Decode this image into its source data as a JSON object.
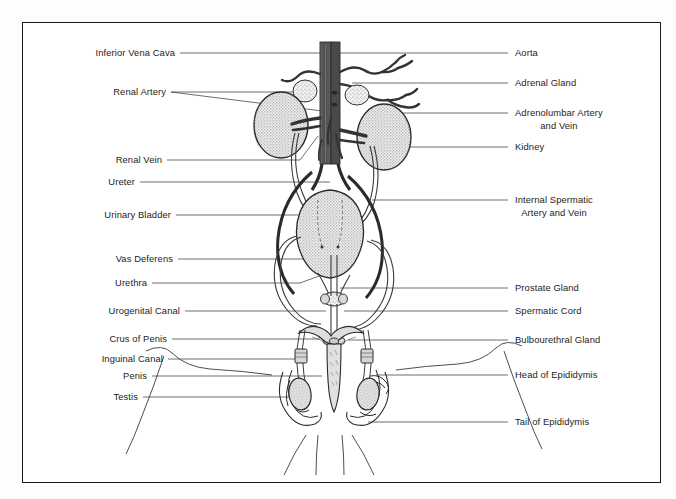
{
  "figure": {
    "frame": {
      "border_color": "#1a1a1a",
      "background": "#ffffff"
    },
    "colors": {
      "vessel_dark": "#555555",
      "vessel_outline": "#2b2b2b",
      "organ_fill": "#e9e9e9",
      "organ_stipple": "#6e6e6e",
      "duct_line": "#3a3a3a",
      "label_text": "#1c1c1c",
      "leader_line": "#4a4a4a"
    }
  },
  "labels_left": [
    {
      "id": "inferior-vena-cava",
      "text": "Inferior Vena Cava",
      "y": 53,
      "leader_x_end": 322
    },
    {
      "id": "renal-artery",
      "text": "Renal Artery",
      "y": 92,
      "leader_x_end": 330
    },
    {
      "id": "renal-vein",
      "text": "Renal Vein",
      "y": 160,
      "leader_x_end": 318
    },
    {
      "id": "ureter",
      "text": "Ureter",
      "y": 182,
      "leader_x_end": 330
    },
    {
      "id": "urinary-bladder",
      "text": "Urinary Bladder",
      "y": 215,
      "leader_x_end": 305
    },
    {
      "id": "vas-deferens",
      "text": "Vas Deferens",
      "y": 259,
      "leader_x_end": 330
    },
    {
      "id": "urethra",
      "text": "Urethra",
      "y": 283,
      "leader_x_end": 330
    },
    {
      "id": "urogenital-canal",
      "text": "Urogenital Canal",
      "y": 311,
      "leader_x_end": 326
    },
    {
      "id": "crus-of-penis",
      "text": "Crus of Penis",
      "y": 339,
      "leader_x_end": 320
    },
    {
      "id": "inguinal-canal",
      "text": "Inguinal Canal",
      "y": 359,
      "leader_x_end": 300
    },
    {
      "id": "penis",
      "text": "Penis",
      "y": 376,
      "leader_x_end": 322
    },
    {
      "id": "testis",
      "text": "Testis",
      "y": 397,
      "leader_x_end": 298
    }
  ],
  "labels_right": [
    {
      "id": "aorta",
      "text": "Aorta",
      "y": 53,
      "leader_x_start": 340
    },
    {
      "id": "adrenal-gland",
      "text": "Adrenal Gland",
      "y": 83,
      "leader_x_start": 350
    },
    {
      "id": "adrenolumbar-artery-and-vein",
      "text": "Adrenolumbar Artery",
      "text2": "and Vein",
      "y": 113,
      "leader_x_start": 396
    },
    {
      "id": "kidney",
      "text": "Kidney",
      "y": 147,
      "leader_x_start": 390
    },
    {
      "id": "internal-spermatic-artery-and-vein",
      "text": "Internal Spermatic",
      "text2": "Artery and Vein",
      "y": 200,
      "leader_x_start": 370
    },
    {
      "id": "prostate-gland",
      "text": "Prostate Gland",
      "y": 288,
      "leader_x_start": 340
    },
    {
      "id": "spermatic-cord",
      "text": "Spermatic Cord",
      "y": 311,
      "leader_x_start": 342
    },
    {
      "id": "bulbourethral-gland",
      "text": "Bulbourethral Gland",
      "y": 340,
      "leader_x_start": 346
    },
    {
      "id": "head-of-epididymis",
      "text": "Head of Epididymis",
      "y": 375,
      "leader_x_start": 374
    },
    {
      "id": "tail-of-epididymis",
      "text": "Tail of Epididymis",
      "y": 422,
      "leader_x_start": 366
    }
  ],
  "caption": {
    "text": ""
  }
}
